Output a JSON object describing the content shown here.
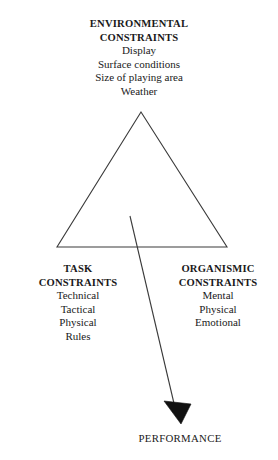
{
  "diagram": {
    "type": "constraints-triangle",
    "background_color": "#ffffff",
    "stroke_color": "#3a3a3a",
    "text_color": "#1a1a1a",
    "environmental": {
      "title_line1": "ENVIRONMENTAL",
      "title_line2": "CONSTRAINTS",
      "items": [
        "Display",
        "Surface conditions",
        "Size of playing area",
        "Weather"
      ]
    },
    "task": {
      "title_line1": "TASK",
      "title_line2": "CONSTRAINTS",
      "items": [
        "Technical",
        "Tactical",
        "Physical",
        "Rules"
      ]
    },
    "organismic": {
      "title_line1": "ORGANISMIC",
      "title_line2": "CONSTRAINTS",
      "items": [
        "Mental",
        "Physical",
        "Emotional"
      ]
    },
    "outcome": {
      "label": "PERFORMANCE"
    }
  }
}
